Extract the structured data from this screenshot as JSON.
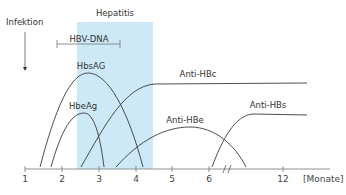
{
  "diagram": {
    "title_band_label": "Hepatitis",
    "infection_label": "Infektion",
    "hbv_dna_label": "HBV-DNA",
    "colors": {
      "hepatitis_band": "#cde8f6",
      "lines": "#3a3a3a",
      "axis": "#555555",
      "text": "#333333"
    },
    "curves": [
      {
        "name": "HbsAG",
        "label": "HbsAG"
      },
      {
        "name": "HbeAg",
        "label": "HbeAg"
      },
      {
        "name": "Anti-HBc",
        "label": "Anti-HBc"
      },
      {
        "name": "Anti-HBe",
        "label": "Anti-HBe"
      },
      {
        "name": "Anti-HBs",
        "label": "Anti-HBs"
      }
    ],
    "axis": {
      "ticks": [
        "1",
        "2",
        "3",
        "4",
        "5",
        "6",
        "12"
      ],
      "unit_label": "[Monate]",
      "has_break": true
    }
  }
}
